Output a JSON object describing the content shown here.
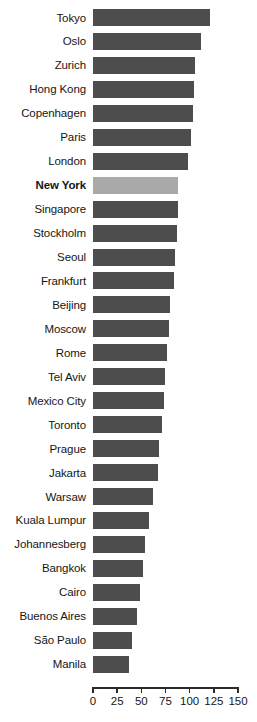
{
  "chart_data": {
    "type": "bar",
    "orientation": "horizontal",
    "title": "",
    "xlabel": "",
    "ylabel": "",
    "xlim": [
      0,
      150
    ],
    "xticks": [
      0,
      25,
      50,
      75,
      100,
      125,
      150
    ],
    "grid": false,
    "legend": null,
    "highlight": "New York",
    "colors": {
      "bar": "#4d4d4d",
      "highlight_bar": "#a9a9a9",
      "axis": "#2b2b2b",
      "text": "#161616",
      "background": "#ffffff"
    },
    "categories": [
      "Tokyo",
      "Oslo",
      "Zurich",
      "Hong Kong",
      "Copenhagen",
      "Paris",
      "London",
      "New York",
      "Singapore",
      "Stockholm",
      "Seoul",
      "Frankfurt",
      "Beijing",
      "Moscow",
      "Rome",
      "Tel Aviv",
      "Mexico City",
      "Toronto",
      "Prague",
      "Jakarta",
      "Warsaw",
      "Kuala Lumpur",
      "Johannesberg",
      "Bangkok",
      "Cairo",
      "Buenos Aires",
      "São Paulo",
      "Manila"
    ],
    "values": [
      121,
      112,
      105,
      104,
      103,
      101,
      98,
      88,
      88,
      87,
      85,
      84,
      80,
      79,
      77,
      74,
      73,
      71,
      68,
      67,
      62,
      58,
      54,
      52,
      49,
      46,
      40,
      37
    ]
  }
}
